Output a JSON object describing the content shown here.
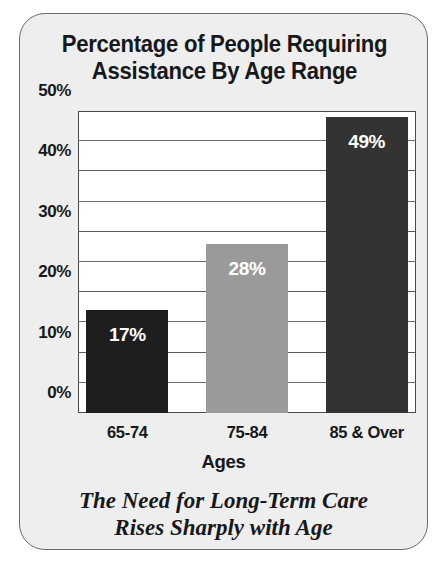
{
  "card": {
    "background_color": "#eeeeee",
    "border_color": "#6b6b6b"
  },
  "title": {
    "line1": "Percentage of People Requiring",
    "line2": "Assistance By Age Range"
  },
  "caption": {
    "line1": "The Need for Long-Term Care",
    "line2": "Rises Sharply with Age"
  },
  "chart_data": {
    "type": "bar",
    "title": "Percentage of People Requiring Assistance By Age Range",
    "subtitle": "The Need for Long-Term Care Rises Sharply with Age",
    "xlabel": "Ages",
    "ylabel": "",
    "categories": [
      "65-74",
      "75-84",
      "85 & Over"
    ],
    "values": [
      17,
      28,
      49
    ],
    "value_labels": [
      "17%",
      "28%",
      "49%"
    ],
    "bar_colors": [
      "#1e1e1e",
      "#9a9a9a",
      "#333333"
    ],
    "value_label_color": "#ffffff",
    "ylim": [
      0,
      50
    ],
    "yticks": [
      0,
      10,
      20,
      30,
      40,
      50
    ],
    "ytick_labels": [
      "0%",
      "10%",
      "20%",
      "30%",
      "40%",
      "50%"
    ],
    "yminor_ticks": [
      5,
      15,
      25,
      35,
      45
    ],
    "grid": true,
    "legend": false,
    "plot_background": "#ffffff",
    "axis_color": "#4a4a4a"
  }
}
